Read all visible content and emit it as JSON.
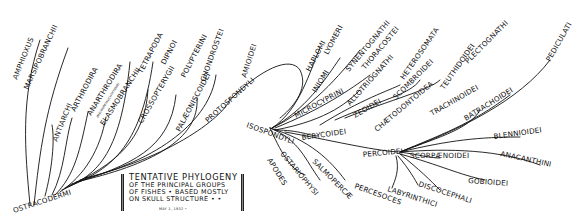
{
  "diagram": {
    "type": "phylogenetic-tree",
    "title": {
      "line1": "TENTATIVE PHYLOGENY",
      "line2": "OF THE PRINCIPAL GROUPS",
      "line3": "OF FISHES • BASED MOSTLY",
      "line4": "ON SKULL STRUCTURE • •",
      "date": "MAY 1, 1932 •"
    },
    "root": "OSTRACODERMI",
    "labels": {
      "amphioxus": "AMPHIOXUS",
      "marsipobranchii": "MARSIPOBRANCHII",
      "antiarchi": "ANTIARCHI",
      "arthrodira": "ARTHRODIRA",
      "anarthrodira": "ANARTHRODIRA",
      "anarthrodira_note": "(MACROPETALICHTHYIDAE)",
      "elasmobranchii": "ELASMOBRANCHII",
      "tetrapoda": "TETRAPODA",
      "dipnoi": "DIPNOI",
      "crossopterygii": "CROSSOPTERYGII",
      "polypterini": "POLYPTERINI",
      "palaeoniscoidei": "PALÆONISCOIDEI",
      "chondrostei": "CHONDROSTEI",
      "protospondyli": "PROTOSPONDYLI",
      "amioidei": "AMIOIDEI",
      "isospondyli": "ISOSPONDYLI",
      "apodes": "APODES",
      "ostariophysi": "OSTARIOPHYSI",
      "salmopercae": "SALMOPERCÆ",
      "haplomi": "HAPLOMI",
      "lyomeri": "LYOMERI",
      "iniomi": "INIOMI",
      "synentognathi": "SYNENTOGNATHI",
      "thoracostei": "THORACOSTEI",
      "microcyprini": "MICROCYPRINI",
      "allotriognathi": "ALLOTRIOGNATHI",
      "zeoidei": "ZEOIDEI",
      "berycoidei": "BERYCOIDEI",
      "heterosomata": "HETEROSOMATA",
      "scombroidei": "SCOMBROIDEI",
      "chaetodontoidea": "CHÆTODONTOIDEA",
      "teuthidoidei": "TEUTHIDOIDEI",
      "plectognathi": "PLECTOGNATHI",
      "trachinoidei": "TRACHINOIDEI",
      "batrachoidei": "BATRACHOIDEI",
      "pediculati": "PEDICULATI",
      "percoidei": "PERCOIDEI",
      "blennioidei": "BLENNIOIDEI",
      "anacanthini": "ANACANTHINI",
      "scorpaenoidei": "SCORPÆNOIDEI",
      "gobioidei": "GOBIOIDEI",
      "discocephali": "DISCOCEPHALI",
      "labyrinthici": "LABYRINTHICI",
      "percesoces": "PERCESOCES"
    },
    "colors": {
      "ink": "#111111",
      "background": "#ffffff"
    }
  }
}
